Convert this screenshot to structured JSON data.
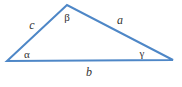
{
  "diagram": {
    "type": "triangle",
    "stroke_color": "#4e87c7",
    "label_color": "#333333",
    "background": "#ffffff",
    "points": "7,61 67,5 173,60",
    "side_labels": {
      "left": "c",
      "right": "a",
      "bottom": "b"
    },
    "angle_labels": {
      "top": "β",
      "bottom_left": "α",
      "bottom_right": "γ"
    }
  }
}
